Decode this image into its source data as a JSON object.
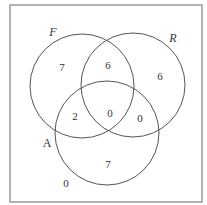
{
  "diagram": {
    "type": "venn-3",
    "sets": [
      {
        "id": "F",
        "label": "F",
        "italic": true
      },
      {
        "id": "R",
        "label": "R",
        "italic": true
      },
      {
        "id": "A",
        "label": "A",
        "italic": false
      }
    ],
    "regions": {
      "F_only": "7",
      "F_and_R_only": "6",
      "R_only": "6",
      "F_and_A_only": "2",
      "F_R_A": "0",
      "R_and_A_only": "0",
      "A_only": "7",
      "none": "0"
    }
  }
}
